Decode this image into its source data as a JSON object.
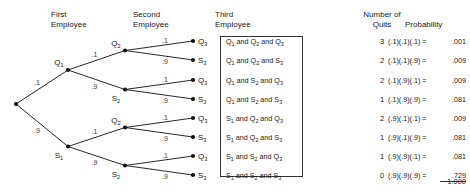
{
  "headers": {
    "first_employee": "First\nEmployee",
    "second_employee": "Second\nEmployee",
    "third_employee": "Third\nEmployee",
    "quits": "Number of\nQuits",
    "probability": "Probability"
  },
  "chart_data": {
    "type": "diagram",
    "branch_probability_quit": ".1",
    "branch_probability_stay": ".9",
    "levels": [
      "First Employee",
      "Second Employee",
      "Third Employee"
    ],
    "node_labels": {
      "level1": [
        "Q₁",
        "S₁"
      ],
      "level2": [
        "Q₂",
        "S₂",
        "Q₂",
        "S₂"
      ],
      "level3": [
        "Q₃",
        "S₃",
        "Q₃",
        "S₃",
        "Q₃",
        "S₃",
        "Q₃",
        "S₃"
      ]
    },
    "edge_labels_level1": [
      ".1",
      ".9"
    ],
    "edge_labels_level2": [
      ".1",
      ".9",
      ".1",
      ".9"
    ],
    "edge_labels_level3": [
      ".1",
      ".9",
      ".1",
      ".9",
      ".1",
      ".9",
      ".1",
      ".9"
    ],
    "outcomes": [
      "Q₁ and Q₂ and Q₃",
      "Q₁ and Q₂ and S₃",
      "Q₁ and S₂ and Q₃",
      "Q₁ and S₂ and S₃",
      "S₁ and Q₂ and Q₃",
      "S₁ and Q₂ and S₃",
      "S₁ and S₂ and Q₃",
      "S₁ and S₂ and S₃"
    ],
    "quits": [
      "3",
      "2",
      "2",
      "1",
      "2",
      "1",
      "1",
      "0"
    ],
    "expressions": [
      "(.1)(.1)(.1) =",
      "(.1)(.1)(.9) =",
      "(.1)(.9)(.1) =",
      "(.1)(.9)(.9) =",
      "(.9)(.1)(.1) =",
      "(.9)(.1)(.9) =",
      "(.9)(.9)(.1) =",
      "(.9)(.9)(.9) ="
    ],
    "probabilities": [
      ".001",
      ".009",
      ".009",
      ".081",
      ".009",
      ".081",
      ".081",
      ".729"
    ],
    "total": "1.000",
    "colors": {
      "line": "#111111",
      "text": "#1a1a1a",
      "box_border": "#333333",
      "background": "#ffffff"
    }
  }
}
